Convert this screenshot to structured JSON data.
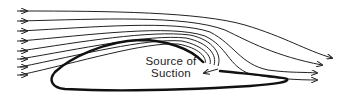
{
  "diagram": {
    "type": "airflow-over-airfoil-with-suction-slot",
    "label": {
      "line1": "Source of",
      "line2": "Suction"
    },
    "streamlines": {
      "count": 8,
      "inflow_arrows": 8,
      "outflow_arrows": 4,
      "sucked_into_slot": 4
    },
    "colors": {
      "line": "#222222",
      "background": "#ffffff"
    }
  }
}
